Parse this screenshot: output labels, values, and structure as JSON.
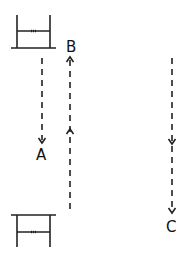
{
  "diagram": {
    "labels": {
      "a": "A",
      "b": "B",
      "c": "C"
    },
    "elements": [
      {
        "name": "top-frame",
        "shape": "inverted-table",
        "description": "frame with base line at bottom, two posts and crossbar"
      },
      {
        "name": "bottom-frame",
        "shape": "table",
        "description": "frame with top line, two posts and crossbar"
      },
      {
        "name": "path-a",
        "style": "dashed",
        "direction": "down",
        "label": "A"
      },
      {
        "name": "path-b",
        "style": "dashed",
        "direction": "up",
        "label": "B"
      },
      {
        "name": "path-c",
        "style": "dashed",
        "direction": "down",
        "label": "C"
      }
    ],
    "colors": {
      "stroke": "#222222",
      "background": "#ffffff"
    }
  }
}
